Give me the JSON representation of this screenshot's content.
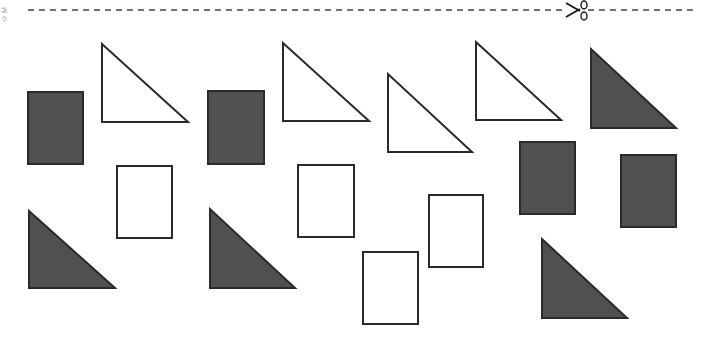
{
  "worksheet": {
    "copyright_mark": "© M",
    "cut_line": {
      "y": 10,
      "x_start": 28,
      "x_end": 697,
      "scissors_x": 574,
      "style": "dashed"
    },
    "colors": {
      "fill_dark": "#505050",
      "stroke": "#2a2a2a",
      "fill_outline": "#ffffff",
      "dash": "#444444"
    },
    "shapes": [
      {
        "type": "rectangle",
        "fill": "dark",
        "x": 28,
        "y": 92,
        "w": 55,
        "h": 72
      },
      {
        "type": "right-triangle",
        "fill": "outline",
        "points": "102,44 102,122 188,122"
      },
      {
        "type": "rectangle",
        "fill": "outline",
        "x": 117,
        "y": 166,
        "w": 55,
        "h": 72
      },
      {
        "type": "right-triangle",
        "fill": "dark",
        "points": "29,211 29,288 115,288"
      },
      {
        "type": "rectangle",
        "fill": "dark",
        "x": 208,
        "y": 91,
        "w": 56,
        "h": 73
      },
      {
        "type": "right-triangle",
        "fill": "outline",
        "points": "283,43 283,121 369,121"
      },
      {
        "type": "rectangle",
        "fill": "outline",
        "x": 298,
        "y": 165,
        "w": 56,
        "h": 72
      },
      {
        "type": "right-triangle",
        "fill": "dark",
        "points": "210,209 210,288 295,288"
      },
      {
        "type": "right-triangle",
        "fill": "outline",
        "points": "388,74 388,152 472,152"
      },
      {
        "type": "rectangle",
        "fill": "outline",
        "x": 363,
        "y": 252,
        "w": 55,
        "h": 72
      },
      {
        "type": "rectangle",
        "fill": "outline",
        "x": 429,
        "y": 195,
        "w": 54,
        "h": 72
      },
      {
        "type": "right-triangle",
        "fill": "outline",
        "points": "476,42 476,120 561,120"
      },
      {
        "type": "rectangle",
        "fill": "dark",
        "x": 520,
        "y": 142,
        "w": 55,
        "h": 72
      },
      {
        "type": "right-triangle",
        "fill": "dark",
        "points": "591,49 591,128 676,128"
      },
      {
        "type": "rectangle",
        "fill": "dark",
        "x": 621,
        "y": 155,
        "w": 55,
        "h": 72
      },
      {
        "type": "right-triangle",
        "fill": "dark",
        "points": "542,239 542,318 627,318"
      }
    ]
  }
}
